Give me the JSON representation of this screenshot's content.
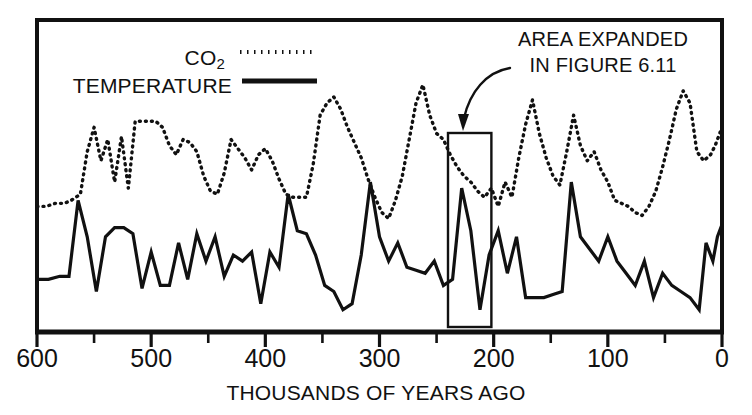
{
  "figure": {
    "background_color": "#ffffff",
    "ink_color": "#111111"
  },
  "legend": {
    "co2_label": "CO",
    "co2_subscript": "2",
    "co2_label_full": "CO2",
    "co2_style": "dotted",
    "temperature_label": "TEMPERATURE",
    "temperature_style": "solid"
  },
  "annotation": {
    "line1": "AREA EXPANDED",
    "line2": "IN FIGURE 6.11",
    "arrow": "curved-arrow-down-left",
    "highlight_box": {
      "x_start_kya": 240,
      "x_end_kya": 202
    }
  },
  "axis": {
    "x_title": "THOUSANDS OF YEARS AGO",
    "x_tick_labels": [
      "600",
      "500",
      "400",
      "300",
      "200",
      "100",
      "0"
    ],
    "x_tick_values": [
      600,
      500,
      400,
      300,
      200,
      100,
      0
    ],
    "x_minor_tick_values": [
      550,
      450,
      350,
      250,
      150,
      50
    ],
    "x_min": 600,
    "x_max": 0,
    "y_axis_labeled": false
  },
  "chart_data": {
    "type": "line",
    "title": "",
    "subtitle": "",
    "xlabel": "THOUSANDS OF YEARS AGO",
    "ylabel": "",
    "xlim": [
      600,
      0
    ],
    "ylim": [
      0,
      100
    ],
    "x_reversed": true,
    "grid": false,
    "legend_position": "top-left",
    "annotations": [
      {
        "text": "AREA EXPANDED IN FIGURE 6.11",
        "x_range_kya": [
          240,
          202
        ],
        "type": "box-with-arrow"
      }
    ],
    "series": [
      {
        "name": "CO2",
        "style": "dotted",
        "x": [
          600,
          592,
          584,
          576,
          570,
          562,
          556,
          550,
          544,
          538,
          532,
          526,
          520,
          514,
          508,
          502,
          496,
          490,
          484,
          478,
          472,
          466,
          460,
          454,
          448,
          442,
          436,
          430,
          424,
          418,
          412,
          406,
          400,
          394,
          388,
          382,
          376,
          370,
          364,
          358,
          352,
          346,
          340,
          334,
          328,
          322,
          316,
          310,
          304,
          298,
          292,
          286,
          280,
          274,
          268,
          262,
          256,
          250,
          244,
          238,
          232,
          226,
          220,
          214,
          208,
          202,
          196,
          190,
          184,
          178,
          172,
          166,
          160,
          154,
          148,
          142,
          136,
          130,
          124,
          118,
          112,
          106,
          100,
          94,
          88,
          82,
          76,
          70,
          64,
          58,
          52,
          46,
          40,
          34,
          28,
          22,
          16,
          10,
          6,
          3,
          0
        ],
        "y": [
          40,
          40,
          41,
          41,
          42,
          44,
          58,
          66,
          55,
          62,
          48,
          63,
          46,
          68,
          68,
          68,
          68,
          66,
          60,
          57,
          62,
          61,
          58,
          50,
          45,
          44,
          51,
          62,
          59,
          56,
          52,
          57,
          59,
          55,
          49,
          44,
          43,
          43,
          43,
          54,
          70,
          74,
          76,
          72,
          66,
          61,
          56,
          49,
          43,
          38,
          36,
          42,
          50,
          62,
          74,
          80,
          70,
          64,
          62,
          57,
          53,
          50,
          48,
          45,
          43,
          46,
          40,
          48,
          43,
          56,
          67,
          75,
          64,
          56,
          50,
          47,
          58,
          70,
          60,
          55,
          58,
          52,
          48,
          42,
          41,
          40,
          38,
          37,
          40,
          45,
          53,
          62,
          72,
          78,
          74,
          58,
          55,
          57,
          60,
          63,
          66
        ]
      },
      {
        "name": "TEMPERATURE",
        "style": "solid",
        "x": [
          600,
          590,
          580,
          572,
          564,
          556,
          548,
          540,
          532,
          524,
          516,
          508,
          500,
          492,
          484,
          476,
          468,
          460,
          452,
          444,
          436,
          428,
          420,
          412,
          404,
          396,
          388,
          380,
          372,
          364,
          356,
          348,
          340,
          332,
          324,
          316,
          308,
          300,
          292,
          284,
          276,
          268,
          260,
          252,
          244,
          236,
          228,
          220,
          212,
          204,
          196,
          188,
          180,
          172,
          164,
          156,
          148,
          140,
          132,
          124,
          116,
          108,
          100,
          92,
          84,
          76,
          68,
          60,
          52,
          44,
          36,
          28,
          20,
          14,
          8,
          4,
          0
        ],
        "y": [
          16,
          16,
          17,
          17,
          42,
          30,
          12,
          30,
          33,
          33,
          31,
          13,
          25,
          14,
          14,
          28,
          16,
          31,
          22,
          30,
          17,
          24,
          22,
          25,
          8,
          25,
          20,
          44,
          32,
          31,
          24,
          14,
          12,
          6,
          8,
          24,
          48,
          30,
          22,
          28,
          20,
          19,
          18,
          22,
          14,
          16,
          46,
          32,
          6,
          24,
          32,
          18,
          30,
          10,
          10,
          10,
          11,
          12,
          48,
          30,
          26,
          22,
          30,
          22,
          18,
          14,
          22,
          10,
          18,
          14,
          12,
          10,
          6,
          28,
          22,
          30,
          34
        ]
      }
    ]
  }
}
